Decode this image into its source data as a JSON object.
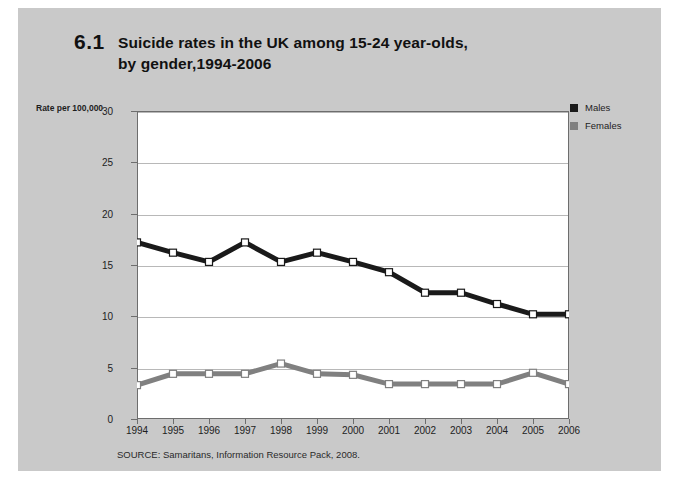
{
  "figure": {
    "number": "6.1",
    "title_line1": "Suicide rates in the UK among 15-24 year-olds,",
    "title_line2": "by gender,1994-2006",
    "source": "SOURCE: Samaritans, Information Resource Pack, 2008."
  },
  "legend": {
    "position": "top-right",
    "entries": [
      {
        "label": "Males",
        "color": "#1a1a1a"
      },
      {
        "label": "Females",
        "color": "#808080"
      }
    ]
  },
  "axes": {
    "y_title": "Rate per 100,000",
    "y_ticks": [
      "0",
      "5",
      "10",
      "15",
      "20",
      "25",
      "30"
    ]
  },
  "chart_data": {
    "type": "line",
    "title": "Suicide rates in the UK among 15-24 year-olds, by gender,1994-2006",
    "xlabel": "",
    "ylabel": "Rate per 100,000",
    "ylim": [
      0,
      30
    ],
    "ytick_step": 5,
    "grid": true,
    "legend_position": "top-right",
    "categories": [
      "1994",
      "1995",
      "1996",
      "1997",
      "1998",
      "1999",
      "2000",
      "2001",
      "2002",
      "2003",
      "2004",
      "2005",
      "2006"
    ],
    "series": [
      {
        "name": "Males",
        "color": "#1a1a1a",
        "marker": "square-white",
        "values": [
          17.2,
          16.2,
          15.3,
          17.2,
          15.3,
          16.2,
          15.3,
          14.3,
          12.3,
          12.3,
          11.2,
          10.2,
          10.2
        ]
      },
      {
        "name": "Females",
        "color": "#808080",
        "marker": "square-white",
        "values": [
          3.3,
          4.4,
          4.4,
          4.4,
          5.4,
          4.4,
          4.3,
          3.4,
          3.4,
          3.4,
          3.4,
          4.5,
          3.4
        ]
      }
    ]
  },
  "colors": {
    "page_background": "#c9c9c9",
    "plot_background": "#ffffff",
    "frame": "#6d6d6d",
    "gridline": "#b8b8b8"
  }
}
